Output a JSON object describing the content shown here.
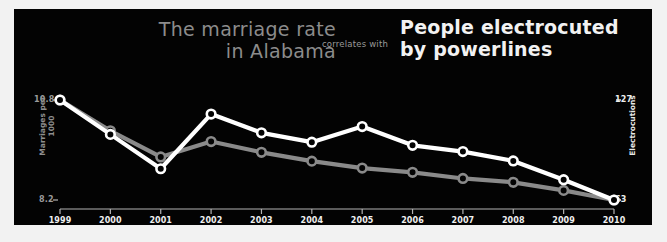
{
  "titles": {
    "left": "The marriage rate\nin Alabama",
    "connector": "correlates with",
    "right": "People electrocuted\nby powerlines"
  },
  "colors": {
    "background": "#030303",
    "frame": "#f2f2f2",
    "series_left": "#8a8a8a",
    "series_right": "#ffffff",
    "axis": "#b4b4b4"
  },
  "chart_data": {
    "type": "line",
    "title": "The marriage rate in Alabama correlates with People electrocuted by powerlines",
    "xlabel": "",
    "grid": false,
    "legend": false,
    "x": [
      1999,
      2000,
      2001,
      2002,
      2003,
      2004,
      2005,
      2006,
      2007,
      2008,
      2009,
      2010
    ],
    "categories": [
      "1999",
      "2000",
      "2001",
      "2002",
      "2003",
      "2004",
      "2005",
      "2006",
      "2007",
      "2008",
      "2009",
      "2010"
    ],
    "axes": {
      "left": {
        "label": "Marriages per 1000",
        "tick_top": "10.8",
        "tick_bottom": "8.2",
        "ylim": [
          8.2,
          10.8
        ]
      },
      "right": {
        "label": "Electrocutions",
        "tick_top": "127",
        "tick_bottom": "63",
        "ylim": [
          63,
          127
        ]
      }
    },
    "series": [
      {
        "name": "Marriages per 1000",
        "axis": "left",
        "color": "#8a8a8a",
        "values": [
          10.8,
          10.0,
          9.32,
          9.72,
          9.44,
          9.21,
          9.03,
          8.92,
          8.76,
          8.66,
          8.45,
          8.2
        ]
      },
      {
        "name": "Electrocutions",
        "axis": "right",
        "color": "#ffffff",
        "values": [
          127,
          105,
          83,
          118,
          106,
          100,
          110,
          98,
          94,
          88,
          76,
          63
        ]
      }
    ]
  }
}
